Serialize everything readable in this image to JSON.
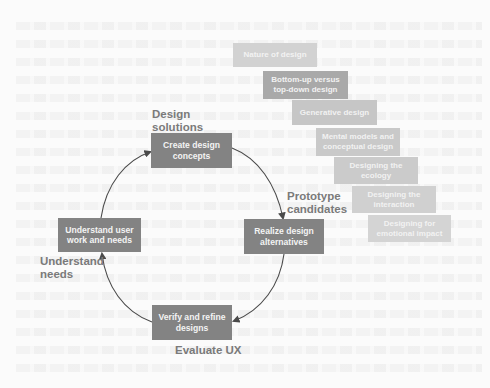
{
  "colors": {
    "background": "#fbfbfb",
    "cycle_box": "#838383",
    "label_text": "#7a7a7a",
    "arrow": "#4a4a4a",
    "stair_shades": [
      "#d2d2d2",
      "#a9a9a9",
      "#c6c6c6",
      "#c9c9c9",
      "#cbcbcb",
      "#d0d0d0",
      "#d4d4d4"
    ]
  },
  "cycle": {
    "top": {
      "label": "Create design concepts",
      "phase": "Design solutions"
    },
    "right": {
      "label": "Realize design alternatives",
      "phase": "Prototype candidates"
    },
    "bottom": {
      "label": "Verify and refine designs",
      "phase": "Evaluate UX"
    },
    "left": {
      "label": "Understand user work and needs",
      "phase": "Understand needs"
    }
  },
  "staircase": [
    {
      "label": "Nature of design"
    },
    {
      "label": "Bottom-up versus top-down design"
    },
    {
      "label": "Generative design"
    },
    {
      "label": "Mental models and conceptual design"
    },
    {
      "label": "Designing the ecology"
    },
    {
      "label": "Designing the interaction"
    },
    {
      "label": "Designing for emotional impact"
    }
  ]
}
